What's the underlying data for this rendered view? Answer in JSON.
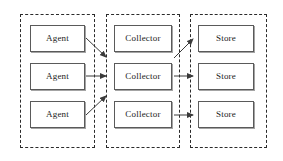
{
  "diagram": {
    "type": "block-diagram",
    "background_color": "#ffffff",
    "groups": [
      {
        "name": "agents-group",
        "border_style": "dashed",
        "border_color": "#2b2b2b",
        "x": 20,
        "y": 14,
        "width": 75,
        "height": 134
      },
      {
        "name": "collectors-group",
        "border_style": "dashed",
        "border_color": "#2b2b2b",
        "x": 106,
        "y": 14,
        "width": 74,
        "height": 134
      },
      {
        "name": "stores-group",
        "border_style": "dashed",
        "border_color": "#2b2b2b",
        "x": 190,
        "y": 14,
        "width": 77,
        "height": 134
      }
    ],
    "nodes": [
      {
        "id": "agent-1",
        "label": "Agent",
        "x": 30,
        "y": 25,
        "width": 55,
        "height": 27
      },
      {
        "id": "agent-2",
        "label": "Agent",
        "x": 30,
        "y": 63,
        "width": 55,
        "height": 27
      },
      {
        "id": "agent-3",
        "label": "Agent",
        "x": 30,
        "y": 101,
        "width": 55,
        "height": 27
      },
      {
        "id": "collector-1",
        "label": "Collector",
        "x": 114,
        "y": 25,
        "width": 58,
        "height": 27
      },
      {
        "id": "collector-2",
        "label": "Collector",
        "x": 114,
        "y": 63,
        "width": 58,
        "height": 27
      },
      {
        "id": "collector-3",
        "label": "Collector",
        "x": 114,
        "y": 101,
        "width": 58,
        "height": 27
      },
      {
        "id": "store-1",
        "label": "Store",
        "x": 198,
        "y": 25,
        "width": 56,
        "height": 27
      },
      {
        "id": "store-2",
        "label": "Store",
        "x": 198,
        "y": 63,
        "width": 56,
        "height": 27
      },
      {
        "id": "store-3",
        "label": "Store",
        "x": 198,
        "y": 101,
        "width": 56,
        "height": 27
      }
    ],
    "arrows": [
      {
        "id": "arrow-agent1-collector1",
        "from": "agent-1",
        "to": "collector-1",
        "x1": 86,
        "y1": 38,
        "x2": 106,
        "y2": 57,
        "color": "#3a3a3a"
      },
      {
        "id": "arrow-agent2-collector2",
        "from": "agent-2",
        "to": "collector-2",
        "x1": 86,
        "y1": 76,
        "x2": 106,
        "y2": 76,
        "color": "#3a3a3a"
      },
      {
        "id": "arrow-agent3-collector3",
        "from": "agent-3",
        "to": "collector-2",
        "x1": 86,
        "y1": 115,
        "x2": 106,
        "y2": 96,
        "color": "#3a3a3a"
      },
      {
        "id": "arrow-collector1-store1",
        "from": "collector-2",
        "to": "store-1",
        "x1": 174,
        "y1": 58,
        "x2": 193,
        "y2": 39,
        "color": "#3a3a3a"
      },
      {
        "id": "arrow-collector2-store2",
        "from": "collector-2",
        "to": "store-2",
        "x1": 174,
        "y1": 76,
        "x2": 193,
        "y2": 76,
        "color": "#3a3a3a"
      },
      {
        "id": "arrow-collector3-store3",
        "from": "collector-3",
        "to": "store-3",
        "x1": 174,
        "y1": 115,
        "x2": 193,
        "y2": 115,
        "color": "#3a3a3a"
      }
    ]
  }
}
